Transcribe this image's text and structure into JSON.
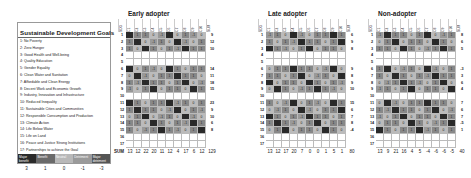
{
  "chart_data": {
    "type": "heatmap",
    "title": "Sustainable Development Goals",
    "goals": [
      "1: No Poverty",
      "2: Zero Hunger",
      "3: Good Health and Well-being",
      "4: Quality Education",
      "5: Gender Equality",
      "6: Clean Water and Sanitation",
      "7: Affordable and Clean Energy",
      "8: Decent Work and Economic Growth",
      "9: Industry, Innovation and Infrastructure",
      "10: Reduced Inequality",
      "11: Sustainable Cities and Communities",
      "12: Responsible Consumption and Production",
      "13: Climate Action",
      "14: Life Below Water",
      "15: Life on Land",
      "16: Peace and Justice Strong Institutions",
      "17: Partnerships to achieve the Goal"
    ],
    "legend": [
      {
        "label": "Major benefit",
        "value": 3,
        "color": "#2a2a2a"
      },
      {
        "label": "Benefit",
        "value": 1,
        "color": "#6a6a6a"
      },
      {
        "label": "Neutral",
        "value": 0,
        "color": "#b8b8b8"
      },
      {
        "label": "Detriment",
        "value": -1,
        "color": "#9a9a9a"
      },
      {
        "label": "Major detriment",
        "value": -3,
        "color": "#555555"
      }
    ],
    "sum_label": "SUM",
    "sdg_label": "SDG",
    "columns": [
      "C1",
      "C2",
      "C3",
      "C4",
      "C5",
      "C6",
      "C7",
      "C8",
      "C9",
      "C10"
    ],
    "panels": [
      {
        "name": "Early adopter",
        "row_sums": [
          9,
          12,
          10,
          null,
          null,
          14,
          11,
          18,
          15,
          null,
          23,
          9,
          10,
          6,
          8,
          null,
          null
        ],
        "col_sums": [
          13,
          12,
          22,
          20,
          11,
          12,
          4,
          17,
          6,
          12
        ],
        "total": 129
      },
      {
        "name": "Late adopter",
        "row_sums": [
          6,
          9,
          8,
          null,
          null,
          9,
          8,
          9,
          10,
          null,
          15,
          6,
          7,
          8,
          -4,
          null,
          null
        ],
        "col_sums": [
          13,
          12,
          17,
          20,
          7,
          0,
          0,
          1,
          5,
          1
        ],
        "total": 80
      },
      {
        "name": "Non-adopter",
        "row_sums": [
          8,
          6,
          5,
          null,
          null,
          -3,
          3,
          6,
          4,
          null,
          7,
          6,
          7,
          -5,
          1,
          null,
          null
        ],
        "col_sums": [
          13,
          9,
          21,
          16,
          4,
          5,
          -4,
          -6,
          -6,
          -5
        ],
        "total": 40
      }
    ]
  }
}
